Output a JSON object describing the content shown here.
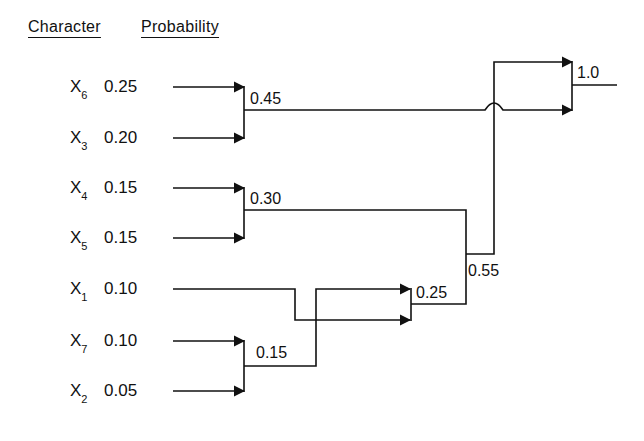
{
  "header": {
    "character_label": "Character",
    "probability_label": "Probability"
  },
  "symbols": [
    {
      "char": "X",
      "sub": "6",
      "prob": "0.25"
    },
    {
      "char": "X",
      "sub": "3",
      "prob": "0.20"
    },
    {
      "char": "X",
      "sub": "4",
      "prob": "0.15"
    },
    {
      "char": "X",
      "sub": "5",
      "prob": "0.15"
    },
    {
      "char": "X",
      "sub": "1",
      "prob": "0.10"
    },
    {
      "char": "X",
      "sub": "7",
      "prob": "0.10"
    },
    {
      "char": "X",
      "sub": "2",
      "prob": "0.05"
    }
  ],
  "nodes": {
    "n045": "0.45",
    "n030": "0.30",
    "n015": "0.15",
    "n025": "0.25",
    "n055": "0.55",
    "n10": "1.0"
  },
  "colors": {
    "ink": "#111111",
    "background": "#ffffff"
  }
}
